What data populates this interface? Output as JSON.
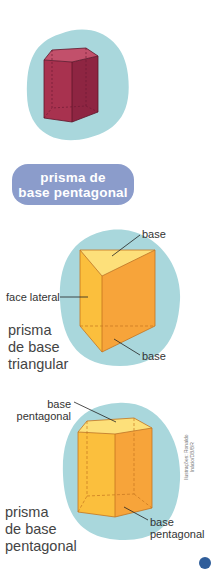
{
  "figures": [
    {
      "id": "pentagonal-prism-red",
      "color": "#a8324f",
      "blob_color": "#a9d7dc"
    },
    {
      "id": "triangular-prism",
      "labels": {
        "base_top": "base",
        "face_lateral": "face lateral",
        "base_bottom": "base"
      },
      "caption": [
        "prisma",
        "de base",
        "triangular"
      ],
      "color": "#f7a43a"
    },
    {
      "id": "pentagonal-prism-orange",
      "labels": {
        "base_top": [
          "base",
          "pentagonal"
        ],
        "base_bottom": [
          "base",
          "pentagonal"
        ]
      },
      "caption": [
        "prisma",
        "de base",
        "pentagonal"
      ],
      "color": "#f7a43a"
    }
  ],
  "label_pill": {
    "line1": "prisma de",
    "line2": "base pentagonal",
    "color": "#8b9ccb"
  },
  "credit": {
    "line1": "Ilustrações: Ronaldo",
    "line2": "Inácio/DB/BR"
  }
}
